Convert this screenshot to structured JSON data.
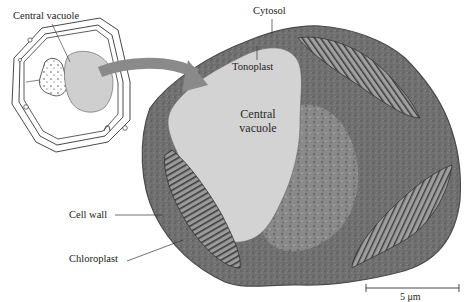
{
  "figure": {
    "type": "plant cell diagram with electron micrograph",
    "schematic": {
      "label": "Central vacuole"
    },
    "micrograph": {
      "labels": {
        "cytosol": "Cytosol",
        "tonoplast": "Tonoplast",
        "central_vacuole_line1": "Central",
        "central_vacuole_line2": "vacuole",
        "cell_wall": "Cell wall",
        "chloroplast": "Chloroplast"
      },
      "scale_bar": {
        "label": "5 μm"
      }
    },
    "colors": {
      "cytoplasm": "#6e6e6e",
      "vacuole": "#d2d2d2",
      "schematic_vacuole": "#cfcfcf",
      "arrow": "#8a8a8a",
      "line": "#333333"
    }
  }
}
